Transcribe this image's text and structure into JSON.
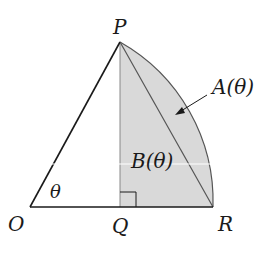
{
  "diagram": {
    "points": {
      "P": "P",
      "O": "O",
      "Q": "Q",
      "R": "R"
    },
    "labels": {
      "angle": "θ",
      "region_A": "A(θ)",
      "region_B": "B(θ)"
    },
    "colors": {
      "line": "#1a1a1a",
      "shade": "#d9d9d9",
      "background": "#ffffff"
    }
  }
}
